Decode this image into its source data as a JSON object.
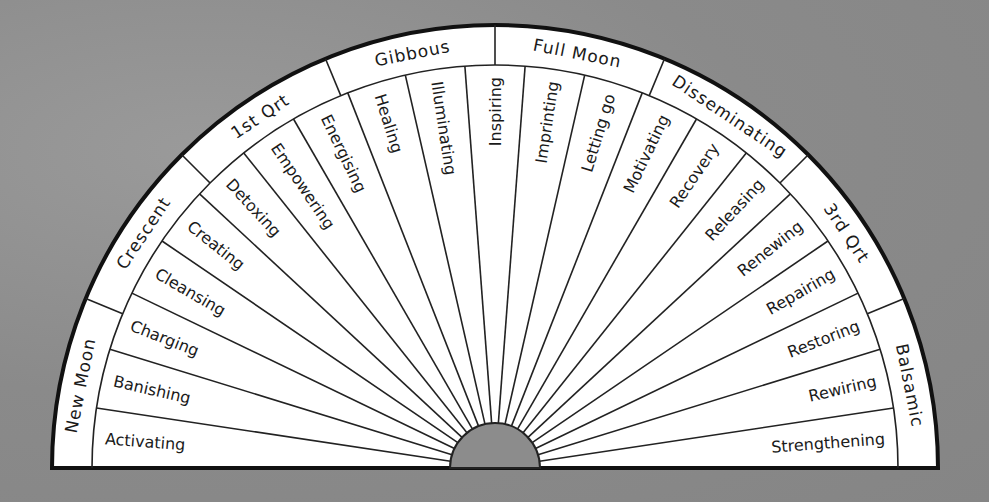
{
  "diagram": {
    "phases": [
      {
        "label": "New Moon"
      },
      {
        "label": "Crescent"
      },
      {
        "label": "1st Qrt"
      },
      {
        "label": "Gibbous"
      },
      {
        "label": "Full Moon"
      },
      {
        "label": "Disseminating"
      },
      {
        "label": "3rd Qrt"
      },
      {
        "label": "Balsamic"
      }
    ],
    "segments": [
      {
        "label": "Activating"
      },
      {
        "label": "Banishing"
      },
      {
        "label": "Charging"
      },
      {
        "label": "Cleansing"
      },
      {
        "label": "Creating"
      },
      {
        "label": "Detoxing"
      },
      {
        "label": "Empowering"
      },
      {
        "label": "Energising"
      },
      {
        "label": "Healing"
      },
      {
        "label": "Illuminating"
      },
      {
        "label": "Inspiring"
      },
      {
        "label": "Imprinting"
      },
      {
        "label": "Letting go"
      },
      {
        "label": "Motivating"
      },
      {
        "label": "Recovery"
      },
      {
        "label": "Releasing"
      },
      {
        "label": "Renewing"
      },
      {
        "label": "Repairing"
      },
      {
        "label": "Restoring"
      },
      {
        "label": "Rewiring"
      },
      {
        "label": "Strengthening"
      }
    ],
    "colors": {
      "background": "#8f8f8f",
      "fill": "#ffffff",
      "stroke": "#111111"
    }
  }
}
